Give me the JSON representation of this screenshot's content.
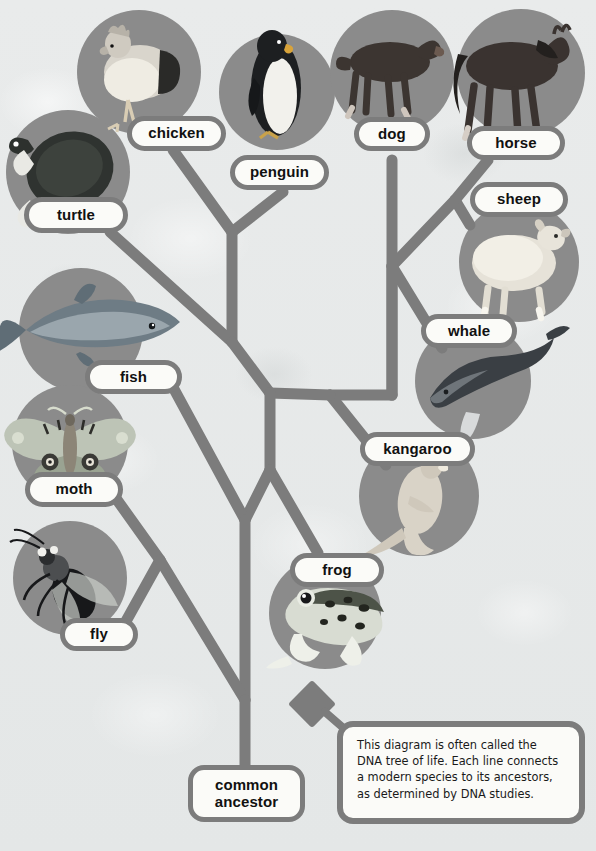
{
  "diagram": {
    "title": "DNA tree of life",
    "type": "phylogenetic-tree",
    "branch_color": "#7c7c7c",
    "circle_color": "#8b8b8b",
    "label_fill": "#fbfbf8",
    "background_color": "#e8eaea"
  },
  "nodes": [
    {
      "id": "turtle",
      "label": "turtle",
      "group": "reptile"
    },
    {
      "id": "chicken",
      "label": "chicken",
      "group": "bird"
    },
    {
      "id": "penguin",
      "label": "penguin",
      "group": "bird"
    },
    {
      "id": "dog",
      "label": "dog",
      "group": "mammal"
    },
    {
      "id": "horse",
      "label": "horse",
      "group": "mammal"
    },
    {
      "id": "sheep",
      "label": "sheep",
      "group": "mammal"
    },
    {
      "id": "whale",
      "label": "whale",
      "group": "mammal"
    },
    {
      "id": "kangaroo",
      "label": "kangaroo",
      "group": "mammal"
    },
    {
      "id": "frog",
      "label": "frog",
      "group": "amphibian"
    },
    {
      "id": "fish",
      "label": "fish",
      "group": "fish"
    },
    {
      "id": "moth",
      "label": "moth",
      "group": "insect"
    },
    {
      "id": "fly",
      "label": "fly",
      "group": "insect"
    },
    {
      "id": "root",
      "label": "common\nancestor",
      "group": "root"
    }
  ],
  "labels": {
    "turtle": "turtle",
    "chicken": "chicken",
    "penguin": "penguin",
    "dog": "dog",
    "horse": "horse",
    "sheep": "sheep",
    "whale": "whale",
    "kangaroo": "kangaroo",
    "frog": "frog",
    "fish": "fish",
    "moth": "moth",
    "fly": "fly",
    "common_ancestor_line1": "common",
    "common_ancestor_line2": "ancestor"
  },
  "callout": {
    "text": "This diagram is often called the\nDNA tree of life. Each line connects\na modern species to its ancestors,\nas determined by DNA studies."
  }
}
